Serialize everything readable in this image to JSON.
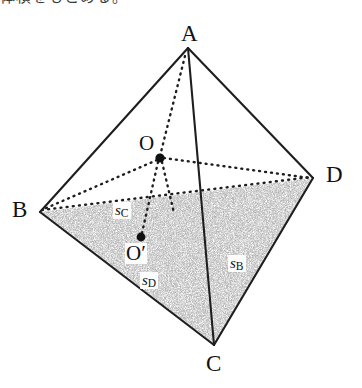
{
  "caption": {
    "text": "体積をもとめる。"
  },
  "figure": {
    "shading_color": "#8a8a8a",
    "line_color": "#1e1e1e",
    "vertices": [
      {
        "name": "A",
        "label": "A",
        "x": 188,
        "y": 48,
        "label_x": 181,
        "label_y": 22
      },
      {
        "name": "B",
        "label": "B",
        "x": 40,
        "y": 212,
        "label_x": 12,
        "label_y": 198
      },
      {
        "name": "C",
        "label": "C",
        "x": 214,
        "y": 345,
        "label_x": 206,
        "label_y": 352
      },
      {
        "name": "D",
        "label": "D",
        "x": 313,
        "y": 178,
        "label_x": 326,
        "label_y": 163
      }
    ],
    "points": [
      {
        "name": "O",
        "label": "O",
        "x": 160,
        "y": 158,
        "label_x": 139,
        "label_y": 133
      },
      {
        "name": "O'",
        "label": "O′",
        "x": 141,
        "y": 237,
        "label_x": 125,
        "label_y": 243
      }
    ],
    "area_labels": [
      {
        "name": "s_B",
        "symbol": "s",
        "sub": "B",
        "x": 228,
        "y": 255
      },
      {
        "name": "s_C",
        "symbol": "s",
        "sub": "C",
        "x": 113,
        "y": 202
      },
      {
        "name": "s_D",
        "symbol": "s",
        "sub": "D",
        "x": 140,
        "y": 272
      }
    ],
    "solid_edges": [
      "AB",
      "AD",
      "AC",
      "BC",
      "CD"
    ],
    "dashed_edges": [
      "BD",
      "OA",
      "OB",
      "OD",
      "OO'"
    ],
    "shaded_face": "BCD"
  }
}
